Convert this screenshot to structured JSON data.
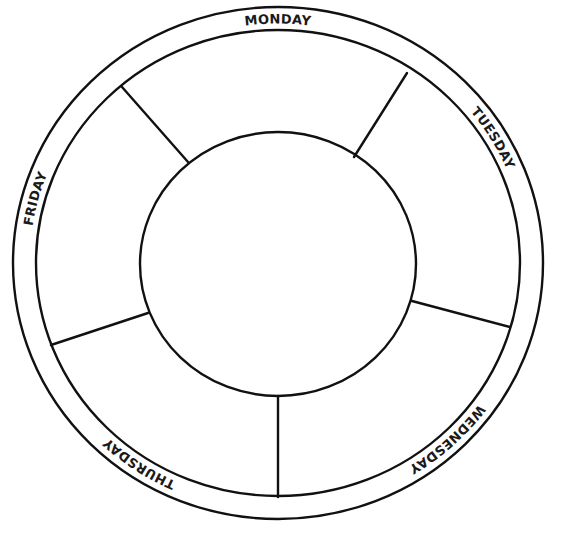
{
  "diagram": {
    "type": "weekly-planner-wheel",
    "stroke_color": "#111111",
    "background_color": "#ffffff",
    "days": [
      {
        "label": "MONDAY"
      },
      {
        "label": "TUESDAY"
      },
      {
        "label": "WEDNESDAY"
      },
      {
        "label": "THURSDAY"
      },
      {
        "label": "FRIDAY"
      }
    ],
    "center": {
      "label": ""
    }
  }
}
